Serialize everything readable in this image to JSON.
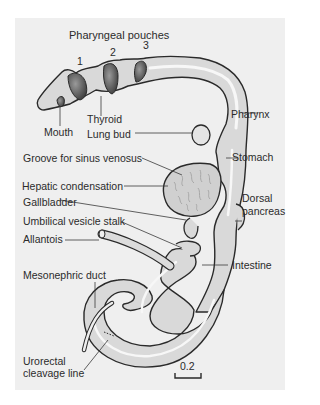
{
  "figure": {
    "title": "Pharyngeal pouches",
    "pouch_numbers": [
      "1",
      "2",
      "3"
    ],
    "scale_bar": "0.2",
    "colors": {
      "background": "#efefef",
      "tissue_fill": "#d9d9d9",
      "lumen_highlight": "#f7f7f7",
      "outline": "#2a2a2a",
      "hepatic_texture": "#a8a8a8",
      "pouch_shadow": "#555555"
    }
  },
  "labels": {
    "mouth": "Mouth",
    "thyroid": "Thyroid",
    "lung_bud": "Lung bud",
    "pharynx": "Pharynx",
    "stomach": "Stomach",
    "groove": "Groove for sinus venosus",
    "hepatic": "Hepatic condensation",
    "gallbladder": "Gallbladder",
    "dorsal_pancreas_1": "Dorsal",
    "dorsal_pancreas_2": "pancreas",
    "umbilical": "Umbilical vesicle stalk",
    "allantois": "Allantois",
    "intestine": "Intestine",
    "mesonephric": "Mesonephric duct",
    "urorectal_1": "Urorectal",
    "urorectal_2": "cleavage line"
  }
}
